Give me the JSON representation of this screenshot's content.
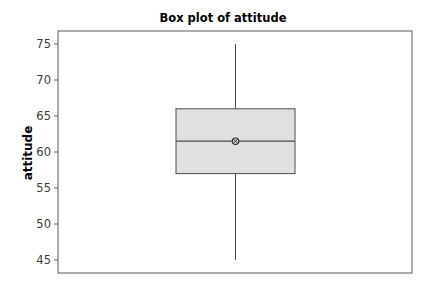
{
  "chart_data": {
    "type": "box",
    "title": "Box plot of attitude",
    "xlabel": "",
    "ylabel": "attitude",
    "ylim": [
      43,
      77
    ],
    "yticks": [
      45,
      50,
      55,
      60,
      65,
      70,
      75
    ],
    "ytick_labels": [
      "45",
      "50",
      "55",
      "60",
      "65",
      "70",
      "75"
    ],
    "grid": false,
    "legend": "none",
    "series": [
      {
        "name": "attitude",
        "min": 45,
        "q1": 57,
        "median": 61.5,
        "q3": 66,
        "max": 75,
        "mean": 61.5
      }
    ],
    "colors": {
      "box_fill": "#e0e0e0",
      "box_stroke": "#4d4d4d",
      "whisker": "#4d4d4d",
      "frame": "#5a5a5a",
      "mean_marker": "#2b2b2b"
    }
  }
}
